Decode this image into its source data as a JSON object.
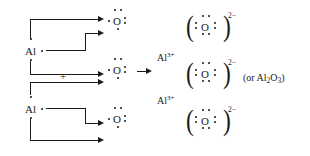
{
  "diagram": {
    "reactants": {
      "aluminum_atoms": [
        {
          "label": "Al",
          "valence_electrons": 3,
          "position": "upper-left"
        },
        {
          "label": "Al",
          "valence_electrons": 3,
          "position": "lower-left"
        }
      ],
      "oxygen_atoms": [
        {
          "label": "O",
          "valence_electrons": 6,
          "position": "upper"
        },
        {
          "label": "O",
          "valence_electrons": 6,
          "position": "middle"
        },
        {
          "label": "O",
          "valence_electrons": 6,
          "position": "lower"
        }
      ],
      "plus_sign": "+"
    },
    "products": {
      "cations": [
        {
          "label": "Al",
          "charge": "3+"
        },
        {
          "label": "Al",
          "charge": "3+"
        }
      ],
      "anions": [
        {
          "label": "O",
          "charge": "2−",
          "valence_electrons": 8
        },
        {
          "label": "O",
          "charge": "2−",
          "valence_electrons": 8
        },
        {
          "label": "O",
          "charge": "2−",
          "valence_electrons": 8
        }
      ],
      "alternate_formula": "(or Al2O3)",
      "alternate_formula_parts": {
        "prefix": "(or Al",
        "sub1": "2",
        "mid": "O",
        "sub2": "3",
        "suffix": ")"
      }
    },
    "reaction_arrow": "→",
    "bracket_left": "(",
    "bracket_right": ")",
    "charge_anion": "2−",
    "charge_cation": "3+"
  }
}
